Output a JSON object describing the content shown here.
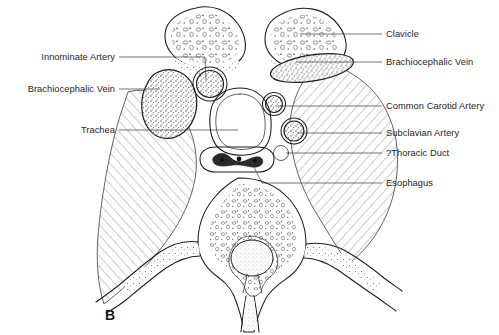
{
  "figure": {
    "panel_letter": "B",
    "panel_letter_x": 105,
    "panel_letter_y": 320,
    "background_color": "#ffffff",
    "ink_color": "#1d1d1d",
    "text_color": "#262626",
    "leader_color": "#3a3a3a"
  },
  "labels": {
    "left": [
      {
        "id": "innominate-artery",
        "text": "Innominate Artery",
        "text_x": 115,
        "text_y": 60,
        "leader": "M119,57 L205,57 L206,80"
      },
      {
        "id": "brachiocephalic-vein-left",
        "text": "Brachiocephalic Vein",
        "text_x": 115,
        "text_y": 92,
        "leader": "M119,89 L160,89"
      },
      {
        "id": "trachea",
        "text": "Trachea",
        "text_x": 115,
        "text_y": 133,
        "leader": "M119,130 L238,130"
      }
    ],
    "right": [
      {
        "id": "clavicle",
        "text": "Clavicle",
        "text_x": 386,
        "text_y": 37,
        "leader": "M382,34 L300,34"
      },
      {
        "id": "brachiocephalic-vein-right",
        "text": "Brachiocephalic Vein",
        "text_x": 386,
        "text_y": 65,
        "leader": "M382,62 L296,62"
      },
      {
        "id": "common-carotid-artery",
        "text": "Common Carotid Artery",
        "text_x": 386,
        "text_y": 109,
        "leader": "M382,106 L277,106"
      },
      {
        "id": "subclavian-artery",
        "text": "Subclavian Artery",
        "text_x": 386,
        "text_y": 136,
        "leader": "M382,133 L297,133"
      },
      {
        "id": "thoracic-duct",
        "text": "?Thoracic Duct",
        "text_x": 386,
        "text_y": 156,
        "leader": "M382,153 L286,153"
      },
      {
        "id": "esophagus",
        "text": "Esophagus",
        "text_x": 386,
        "text_y": 186,
        "leader": "M382,183 L262,183 L252,163"
      }
    ]
  },
  "structures": [
    {
      "id": "clavicle-left",
      "name": "Clavicle (left)"
    },
    {
      "id": "clavicle-right",
      "name": "Clavicle (right)"
    },
    {
      "id": "brachiocephalic-vein-left-shape",
      "name": "Brachiocephalic Vein (left)"
    },
    {
      "id": "brachiocephalic-vein-right-shape",
      "name": "Brachiocephalic Vein (right)"
    },
    {
      "id": "innominate-artery-shape",
      "name": "Innominate Artery"
    },
    {
      "id": "common-carotid-artery-shape",
      "name": "Common Carotid Artery"
    },
    {
      "id": "subclavian-artery-shape",
      "name": "Subclavian Artery"
    },
    {
      "id": "thoracic-duct-shape",
      "name": "?Thoracic Duct"
    },
    {
      "id": "trachea-shape",
      "name": "Trachea"
    },
    {
      "id": "esophagus-shape",
      "name": "Esophagus"
    },
    {
      "id": "vertebral-body",
      "name": "Vertebral body"
    },
    {
      "id": "spinal-cord",
      "name": "Spinal cord"
    },
    {
      "id": "muscle-left-shape",
      "name": "Paravertebral musculature (left)"
    },
    {
      "id": "muscle-right-shape",
      "name": "Paravertebral musculature (right)"
    }
  ]
}
